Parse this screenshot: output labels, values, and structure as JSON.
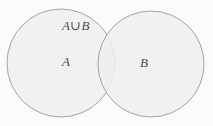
{
  "figure": {
    "type": "venn-diagram",
    "title": "",
    "background_color": "#fbfbfb",
    "sets": [
      {
        "id": "A",
        "label": "A",
        "shape": "circle",
        "center_x": 61,
        "center_y": 63,
        "radius": 54,
        "fill_color": "#eeeeee",
        "stroke_color": "#9a9a9a"
      },
      {
        "id": "B",
        "label": "B",
        "shape": "circle",
        "center_x": 151,
        "center_y": 64,
        "radius": 53,
        "fill_color": "#eeeeee",
        "stroke_color": "#9a9a9a"
      }
    ],
    "region_labels": [
      {
        "id": "union",
        "text": "A∪B",
        "meaning": "A union B",
        "x": 62,
        "y": 19
      },
      {
        "id": "set-a",
        "text": "A",
        "meaning": "set A",
        "x": 62,
        "y": 55
      },
      {
        "id": "set-b",
        "text": "B",
        "meaning": "set B",
        "x": 140,
        "y": 56
      }
    ]
  }
}
